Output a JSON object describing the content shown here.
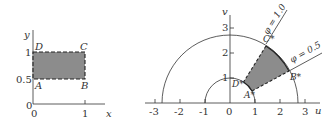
{
  "left_panel": {
    "x_axis_label": "x",
    "y_axis_label": "y",
    "origin_label": "0",
    "x_ticks": [
      {
        "value": "0",
        "px": 33
      },
      {
        "value": "1",
        "px": 85
      }
    ],
    "y_ticks": [
      {
        "value": "0",
        "py": 104
      },
      {
        "value": "0.5",
        "py": 79
      },
      {
        "value": "1",
        "py": 52
      }
    ],
    "corners": {
      "A": "A",
      "B": "B",
      "C": "C",
      "D": "D"
    },
    "region": {
      "x": [
        0,
        1
      ],
      "y": [
        0.5,
        1
      ]
    }
  },
  "right_panel": {
    "u_axis_label": "u",
    "v_axis_label": "v",
    "u_ticks": [
      "-3",
      "-2",
      "-1",
      "0",
      "1",
      "2",
      "3"
    ],
    "v_ticks": [
      "1",
      "2",
      "3"
    ],
    "corners": {
      "A": "A*",
      "B": "B*",
      "C": "C*",
      "D": "D*"
    },
    "ray_labels": {
      "phi_high": "φ = 1.0",
      "phi_low": "φ = 0.5"
    },
    "arc_labels": {
      "inner": "1"
    }
  },
  "colors": {
    "fill": "#8c8c8c",
    "line": "#333333"
  }
}
